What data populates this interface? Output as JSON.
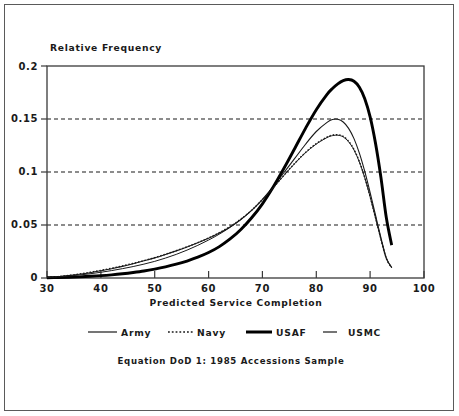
{
  "chart_data": {
    "type": "line",
    "title": "",
    "caption": "Equation DoD 1: 1985 Accessions Sample",
    "xlabel": "Predicted Service Completion",
    "ylabel": "Relative Frequency",
    "xlim": [
      30,
      100
    ],
    "ylim": [
      0,
      0.2
    ],
    "xticks": [
      30,
      40,
      50,
      60,
      70,
      80,
      90,
      100
    ],
    "xtick_labels": [
      "30",
      "40",
      "50",
      "60",
      "70",
      "80",
      "90",
      "100"
    ],
    "yticks": [
      0,
      0.05,
      0.1,
      0.15,
      0.2
    ],
    "ytick_labels": [
      "0",
      "0.05",
      "0.1",
      "0.15",
      "0.2"
    ],
    "grid": "horizontal-dashed",
    "legend_position": "below-axis",
    "x": [
      30,
      32,
      34,
      36,
      38,
      40,
      42,
      44,
      46,
      48,
      50,
      52,
      54,
      56,
      58,
      60,
      62,
      64,
      66,
      68,
      70,
      72,
      74,
      76,
      78,
      80,
      82,
      83,
      84,
      85,
      86,
      87,
      88,
      89,
      90,
      91,
      92,
      93,
      94
    ],
    "series": [
      {
        "name": "Army",
        "style": "thin-solid",
        "color": "#1a1a1a",
        "values": [
          0.0005,
          0.0012,
          0.0022,
          0.0035,
          0.005,
          0.0068,
          0.0088,
          0.011,
          0.0135,
          0.0162,
          0.019,
          0.0222,
          0.0256,
          0.0292,
          0.0332,
          0.0375,
          0.0424,
          0.0482,
          0.0552,
          0.0638,
          0.0742,
          0.0862,
          0.0995,
          0.1128,
          0.1262,
          0.1382,
          0.1468,
          0.1495,
          0.1497,
          0.1472,
          0.1412,
          0.1315,
          0.1178,
          0.1005,
          0.0805,
          0.0592,
          0.0382,
          0.019,
          0.01
        ]
      },
      {
        "name": "Navy",
        "style": "dotted",
        "color": "#1a1a1a",
        "values": [
          0.0005,
          0.0013,
          0.0024,
          0.0038,
          0.0054,
          0.0072,
          0.0092,
          0.0114,
          0.0138,
          0.0164,
          0.0192,
          0.0224,
          0.0258,
          0.0294,
          0.0334,
          0.0378,
          0.0428,
          0.0486,
          0.0556,
          0.064,
          0.074,
          0.0852,
          0.097,
          0.1082,
          0.1185,
          0.1268,
          0.133,
          0.1348,
          0.1352,
          0.1336,
          0.129,
          0.1212,
          0.1098,
          0.0948,
          0.0768,
          0.0568,
          0.0368,
          0.0185,
          0.0098
        ]
      },
      {
        "name": "USAF",
        "style": "thick-solid",
        "color": "#000000",
        "values": [
          0.0002,
          0.0004,
          0.0007,
          0.0011,
          0.0016,
          0.0022,
          0.003,
          0.004,
          0.0052,
          0.0066,
          0.0084,
          0.0105,
          0.013,
          0.016,
          0.0196,
          0.024,
          0.0296,
          0.0368,
          0.0458,
          0.0568,
          0.07,
          0.0858,
          0.1035,
          0.1222,
          0.1412,
          0.1588,
          0.1732,
          0.1788,
          0.1832,
          0.1862,
          0.1872,
          0.1856,
          0.18,
          0.1692,
          0.152,
          0.127,
          0.095,
          0.057,
          0.031
        ]
      },
      {
        "name": "USMC",
        "style": "short-dash",
        "color": "#1a1a1a",
        "values": [
          0.0004,
          0.001,
          0.0018,
          0.0028,
          0.004,
          0.0054,
          0.007,
          0.0088,
          0.0108,
          0.0131,
          0.0157,
          0.0188,
          0.0223,
          0.0263,
          0.0308,
          0.0358,
          0.0414,
          0.0478,
          0.0552,
          0.0638,
          0.0738,
          0.085,
          0.0968,
          0.108,
          0.1182,
          0.1264,
          0.1325,
          0.1343,
          0.1347,
          0.1331,
          0.1285,
          0.1208,
          0.1094,
          0.0945,
          0.0765,
          0.0566,
          0.0366,
          0.0184,
          0.0097
        ]
      }
    ]
  },
  "legend": {
    "items": [
      {
        "label": "Army",
        "style": "thin-solid"
      },
      {
        "label": "Navy",
        "style": "dotted"
      },
      {
        "label": "USAF",
        "style": "thick-solid"
      },
      {
        "label": "USMC",
        "style": "short-dash"
      }
    ]
  },
  "axes": {
    "y_title": "Relative Frequency",
    "x_title": "Predicted Service Completion"
  },
  "caption": {
    "text": "Equation DoD 1: 1985 Accessions Sample"
  },
  "colors": {
    "ink": "#1a1a1a",
    "frame": "#5a5a5a",
    "background": "#ffffff"
  }
}
